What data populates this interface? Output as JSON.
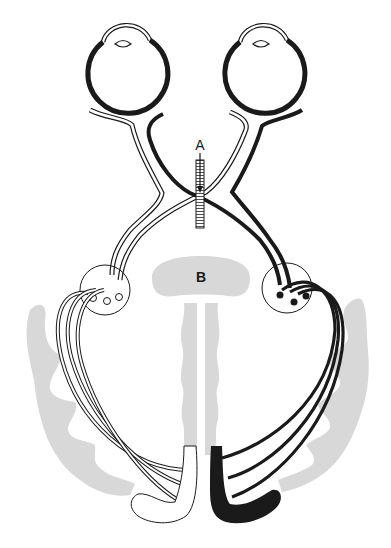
{
  "diagram": {
    "labels": {
      "a": "A",
      "b": "B"
    },
    "colors": {
      "ink": "#1a1a1a",
      "shade": "#d8d8d8",
      "paper": "#ffffff"
    },
    "elements": {
      "left_eye": "left eye (white pathway)",
      "right_eye": "right eye (black pathway)",
      "chiasm_cut": "optic chiasm sectioned at A",
      "structure_b": "midline structure B",
      "left_lgn": "left lateral geniculate nucleus (open relay cells)",
      "right_lgn": "right lateral geniculate nucleus (filled relay cells)",
      "left_cortex": "left visual cortex (white)",
      "right_cortex": "right visual cortex (black)"
    }
  }
}
